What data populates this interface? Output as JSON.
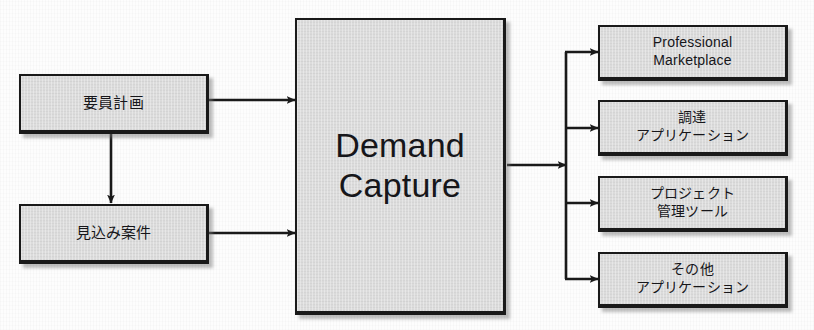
{
  "diagram": {
    "background_color": "#fdfdfd",
    "node_fill_color": "#dcdcdc",
    "node_border_color": "#1a1a1a",
    "connector_color": "#1a1a1a",
    "inputs": [
      {
        "id": "headcount-plan",
        "label": "要員計画"
      },
      {
        "id": "prospective-deals",
        "label": "見込み案件"
      }
    ],
    "hub": {
      "id": "demand-capture",
      "label": "Demand\nCapture"
    },
    "outputs": [
      {
        "id": "professional-marketplace",
        "label": "Professional\nMarketplace"
      },
      {
        "id": "procurement-application",
        "label": "調達\nアプリケーション"
      },
      {
        "id": "project-management-tool",
        "label": "プロジェクト\n管理ツール"
      },
      {
        "id": "other-application",
        "label": "その他\nアプリケーション"
      }
    ],
    "connectors": [
      {
        "id": "headcount-plan-to-demand-capture",
        "from": "headcount-plan",
        "to": "demand-capture",
        "style": "arrow-right"
      },
      {
        "id": "headcount-plan-to-prospective-deals",
        "from": "headcount-plan",
        "to": "prospective-deals",
        "style": "arrow-down"
      },
      {
        "id": "prospective-deals-to-demand-capture",
        "from": "prospective-deals",
        "to": "demand-capture",
        "style": "arrow-right"
      },
      {
        "id": "demand-capture-to-fanout",
        "from": "demand-capture",
        "to": "fanout-trunk",
        "style": "arrow-right"
      },
      {
        "id": "fanout-to-professional-marketplace",
        "from": "fanout-trunk",
        "to": "professional-marketplace",
        "style": "arrow-right"
      },
      {
        "id": "fanout-to-procurement-application",
        "from": "fanout-trunk",
        "to": "procurement-application",
        "style": "arrow-right"
      },
      {
        "id": "fanout-to-project-management-tool",
        "from": "fanout-trunk",
        "to": "project-management-tool",
        "style": "arrow-right"
      },
      {
        "id": "fanout-to-other-application",
        "from": "fanout-trunk",
        "to": "other-application",
        "style": "arrow-right"
      }
    ]
  }
}
